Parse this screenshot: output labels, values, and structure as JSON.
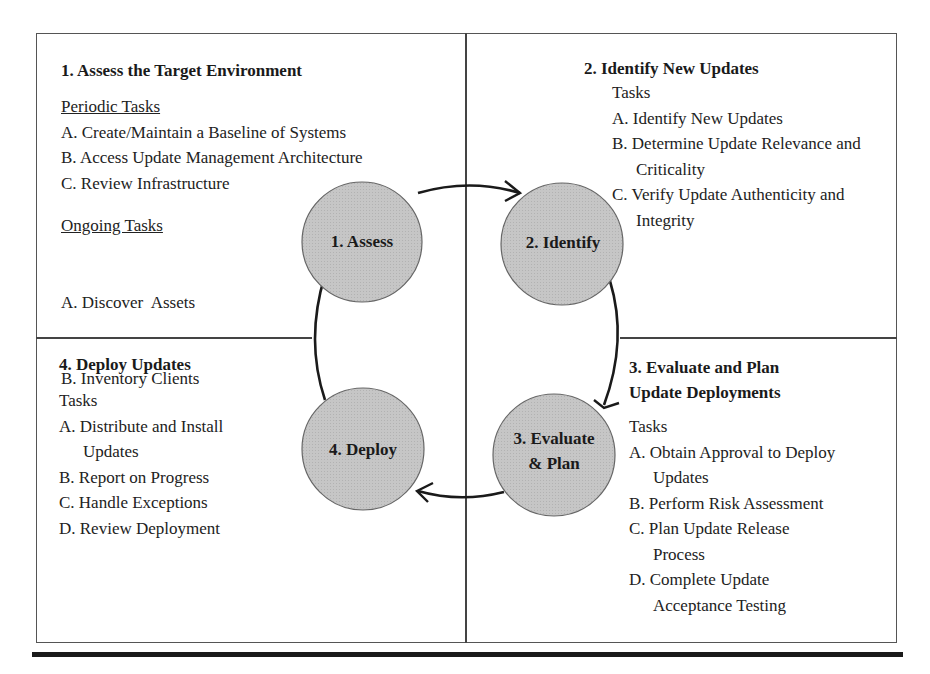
{
  "quadrants": {
    "assess": {
      "title": "1. Assess the Target Environment",
      "periodic_heading": "Periodic Tasks",
      "periodic_tasks": [
        "A. Create/Maintain a Baseline of Systems",
        "B. Access Update Management Architecture",
        "C. Review Infrastructure"
      ],
      "ongoing_heading": "Ongoing Tasks",
      "ongoing_tasks": [
        "A. Discover  Assets",
        "B. Inventory Clients"
      ]
    },
    "identify": {
      "title": "2. Identify New Updates",
      "tasks_heading": "Tasks",
      "tasks": [
        "A. Identify New Updates",
        "B. Determine Update Relevance and Criticality",
        "C. Verify Update Authenticity and Integrity"
      ]
    },
    "evaluate": {
      "title_line1": "3. Evaluate and Plan",
      "title_line2": "Update Deployments",
      "tasks_heading": "Tasks",
      "tasks": [
        "A. Obtain Approval to Deploy Updates",
        "B. Perform Risk Assessment",
        "C. Plan Update Release Process",
        "D. Complete Update Acceptance Testing"
      ]
    },
    "deploy": {
      "title": "4. Deploy Updates",
      "tasks_heading": "Tasks",
      "tasks": [
        "A. Distribute and Install Updates",
        "B. Report on Progress",
        "C. Handle Exceptions",
        "D. Review Deployment"
      ]
    }
  },
  "cycle": {
    "nodes": [
      {
        "label": "1. Assess"
      },
      {
        "label": "2. Identify"
      },
      {
        "label_line1": "3. Evaluate",
        "label_line2": "& Plan"
      },
      {
        "label": "4. Deploy"
      }
    ],
    "node_fill": "#c4c4c4",
    "node_stroke": "#666666",
    "arrow_color": "#1a1a1a"
  }
}
